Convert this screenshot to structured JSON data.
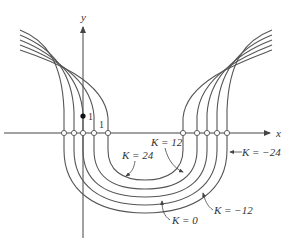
{
  "figure": {
    "axes": {
      "x_label": "x",
      "y_label": "y",
      "origin_px": [
        83,
        133
      ]
    },
    "markers": {
      "point_label": "1",
      "x_tick_label": "1"
    },
    "curve_labels": [
      {
        "key": "k24",
        "text": "K = 24"
      },
      {
        "key": "k12",
        "text": "K = 12"
      },
      {
        "key": "k0",
        "text": "K = 0"
      },
      {
        "key": "km12",
        "text": "K = −12"
      },
      {
        "key": "km24",
        "text": "K = −24"
      }
    ],
    "colors": {
      "curve": "#555555",
      "axis": "#444444",
      "text": "#333333",
      "background": "#ffffff"
    }
  }
}
